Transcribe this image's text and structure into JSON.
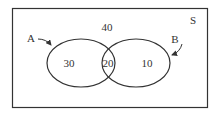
{
  "diagram": {
    "type": "venn",
    "universe_label": "S",
    "sets": [
      {
        "label": "A",
        "only_value": "30"
      },
      {
        "label": "B",
        "only_value": "10"
      }
    ],
    "intersection_value": "20",
    "outside_value": "40"
  }
}
